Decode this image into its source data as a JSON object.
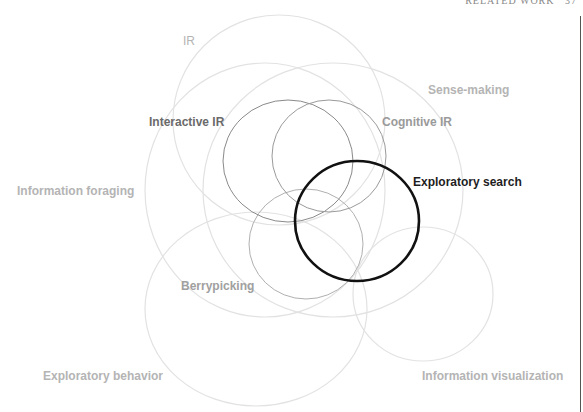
{
  "header": {
    "running_title": "RELATED WORK",
    "page_number": "37"
  },
  "diagram": {
    "type": "overlapping-circles",
    "nodes": [
      {
        "id": "ir",
        "label": "IR",
        "emphasis": "light",
        "color": "#b4b4b4",
        "stroke": "#e2e2e2",
        "label_x": 183,
        "label_y": 34
      },
      {
        "id": "sense-making",
        "label": "Sense-making",
        "emphasis": "light",
        "color": "#b4b4b4",
        "stroke": "#e2e2e2",
        "label_x": 428,
        "label_y": 83
      },
      {
        "id": "interactive-ir",
        "label": "Interactive IR",
        "emphasis": "medium",
        "color": "#6a6a6a",
        "stroke": "#8a8a8a",
        "label_x": 149,
        "label_y": 115
      },
      {
        "id": "cognitive-ir",
        "label": "Cognitive IR",
        "emphasis": "medium-light",
        "color": "#9a9a9a",
        "stroke": "#9a9a9a",
        "label_x": 382,
        "label_y": 115
      },
      {
        "id": "exploratory-search",
        "label": "Exploratory search",
        "emphasis": "strong",
        "color": "#1e1e1e",
        "stroke": "#111111",
        "label_x": 413,
        "label_y": 175
      },
      {
        "id": "information-foraging",
        "label": "Information foraging",
        "emphasis": "light",
        "color": "#b4b4b4",
        "stroke": "#e2e2e2",
        "label_x": 17,
        "label_y": 184
      },
      {
        "id": "berrypicking",
        "label": "Berrypicking",
        "emphasis": "medium-light",
        "color": "#a0a0a0",
        "stroke": "#b0b0b0",
        "label_x": 181,
        "label_y": 279
      },
      {
        "id": "exploratory-behavior",
        "label": "Exploratory behavior",
        "emphasis": "light",
        "color": "#b4b4b4",
        "stroke": "#e2e2e2",
        "label_x": 43,
        "label_y": 369
      },
      {
        "id": "information-visualization",
        "label": "Information visualization",
        "emphasis": "light",
        "color": "#b4b4b4",
        "stroke": "#e2e2e2",
        "label_x": 422,
        "label_y": 369
      }
    ]
  }
}
